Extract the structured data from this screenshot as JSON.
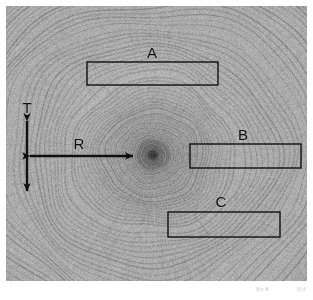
{
  "figure": {
    "kind": "wood-cross-section-micrograph",
    "description_text": "",
    "background_color": "#ffffff",
    "panel": {
      "left": 6,
      "top": 6,
      "width": 301,
      "height": 275,
      "base_color": "#adadad",
      "ring_dark_color": "#6f6f6f",
      "ring_light_color": "#c9c9c9"
    },
    "pith": {
      "x": 153,
      "y": 155,
      "core_color": "#2b2b2b"
    }
  },
  "labels": {
    "a": "A",
    "b": "B",
    "c": "C",
    "tangential": "T",
    "radial": "R"
  },
  "regions": [
    {
      "id": "a",
      "label": "A",
      "x": 87,
      "y": 62,
      "width": 131,
      "height": 23,
      "label_x": 152,
      "label_y": 45
    },
    {
      "id": "b",
      "label": "B",
      "x": 190,
      "y": 144,
      "width": 111,
      "height": 24,
      "label_x": 243,
      "label_y": 127
    },
    {
      "id": "c",
      "label": "C",
      "x": 168,
      "y": 212,
      "width": 112,
      "height": 25,
      "label_x": 221,
      "label_y": 194
    }
  ],
  "arrows": {
    "tangential": {
      "label": "T",
      "orientation": "vertical",
      "x": 27,
      "y1": 121,
      "y2": 191,
      "label_x": 27,
      "label_y": 100
    },
    "radial": {
      "label": "R",
      "orientation": "horizontal",
      "y": 156,
      "x1": 30,
      "x2": 133,
      "label_x": 79,
      "label_y": 136
    }
  },
  "stroke": {
    "color": "#101010",
    "rect_width": 1.4,
    "arrow_width": 2.4
  },
  "watermark": {
    "left": "阪大 産",
    "right": "研 ほ"
  }
}
